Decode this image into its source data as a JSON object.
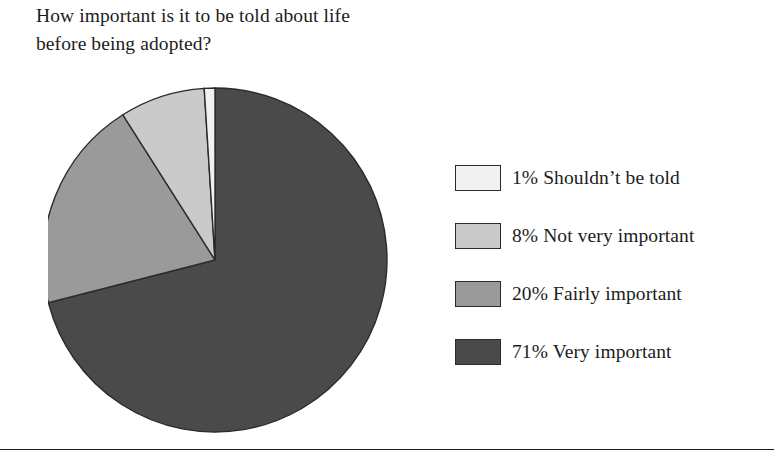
{
  "figure": {
    "title": "How important is it to be told about life\nbefore being adopted?",
    "background_color": "#ffffff",
    "rule_color": "#1d1d1d"
  },
  "chart_data": {
    "type": "pie",
    "title": "How important is it to be told about life before being adopted?",
    "xlabel": "",
    "ylabel": "",
    "legend_position": "right",
    "grid": false,
    "start_angle_deg": 90,
    "direction": "clockwise",
    "categories": [
      "Very important",
      "Fairly important",
      "Not very important",
      "Shouldn't be told"
    ],
    "values": [
      71,
      20,
      8,
      1
    ],
    "unit": "%",
    "slices": [
      {
        "order": 1,
        "label": "Very important",
        "value": 71,
        "value_label": "71%",
        "legend_text": "71% Very important",
        "color": "#4a4a4a",
        "legend_index": 4
      },
      {
        "order": 2,
        "label": "Fairly important",
        "value": 20,
        "value_label": "20%",
        "legend_text": "20% Fairly important",
        "color": "#9a9a9a",
        "legend_index": 3
      },
      {
        "order": 3,
        "label": "Not very important",
        "value": 8,
        "value_label": "8%",
        "legend_text": "8% Not very important",
        "color": "#cacaca",
        "legend_index": 2
      },
      {
        "order": 4,
        "label": "Shouldn't be told",
        "value": 1,
        "value_label": "1%",
        "legend_text": "1% Shouldn’t be told",
        "color": "#f1f1f1",
        "legend_index": 1
      }
    ]
  },
  "legend": {
    "items": [
      {
        "text": "1% Shouldn’t be told",
        "color": "#f1f1f1",
        "percent": "1%",
        "category": "Shouldn’t be told"
      },
      {
        "text": "8% Not very important",
        "color": "#cacaca",
        "percent": "8%",
        "category": "Not very important"
      },
      {
        "text": "20% Fairly important",
        "color": "#9a9a9a",
        "percent": "20%",
        "category": "Fairly important"
      },
      {
        "text": "71% Very important",
        "color": "#4a4a4a",
        "percent": "71%",
        "category": "Very important"
      }
    ]
  }
}
